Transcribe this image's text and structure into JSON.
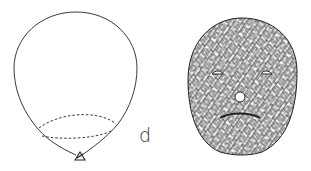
{
  "figure": {
    "panel_label": "d",
    "left_object": "balloon-outline",
    "right_object": "textured-face",
    "colors": {
      "stroke": "#222222",
      "background": "#ffffff"
    }
  }
}
